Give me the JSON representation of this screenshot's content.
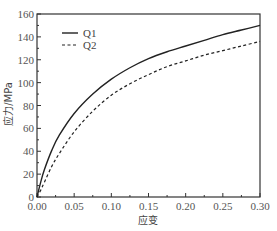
{
  "chart_data": {
    "type": "line",
    "title": "",
    "xlabel": "应变",
    "ylabel": "应力/MPa",
    "xlim": [
      0,
      0.3
    ],
    "ylim": [
      0,
      160
    ],
    "xticks": [
      "0.00",
      "0.05",
      "0.10",
      "0.15",
      "0.20",
      "0.25",
      "0.30"
    ],
    "yticks": [
      "0",
      "20",
      "40",
      "60",
      "80",
      "100",
      "120",
      "140",
      "160"
    ],
    "grid": false,
    "legend_position": "upper left",
    "x": [
      0,
      0.005,
      0.01,
      0.02,
      0.03,
      0.05,
      0.075,
      0.1,
      0.125,
      0.15,
      0.175,
      0.2,
      0.225,
      0.25,
      0.275,
      0.3
    ],
    "series": [
      {
        "name": "Q1",
        "style": "solid",
        "color": "#222222",
        "values": [
          0,
          13,
          24,
          41,
          54,
          73,
          90,
          103,
          113,
          121,
          127,
          132,
          137,
          142,
          146,
          150
        ]
      },
      {
        "name": "Q2",
        "style": "dashed",
        "color": "#222222",
        "values": [
          0,
          6,
          13,
          27,
          38,
          57,
          75,
          89,
          99,
          107,
          114,
          119,
          124,
          128,
          132,
          136
        ]
      }
    ]
  },
  "legend": [
    {
      "label": "Q1",
      "style": "solid"
    },
    {
      "label": "Q2",
      "style": "dashed"
    }
  ]
}
